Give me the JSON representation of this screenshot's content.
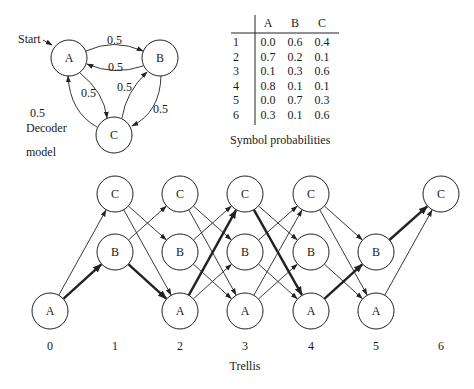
{
  "decoder_model": {
    "caption_line1": "Decoder",
    "caption_line2": "model",
    "start_label": "Start",
    "states": [
      {
        "id": "A",
        "label": "A",
        "cx": 69,
        "cy": 58
      },
      {
        "id": "B",
        "label": "B",
        "cx": 160,
        "cy": 58
      },
      {
        "id": "C",
        "label": "C",
        "cx": 114,
        "cy": 135
      }
    ],
    "transitions": [
      {
        "from": "A",
        "to": "B",
        "prob": "0.5"
      },
      {
        "from": "B",
        "to": "A",
        "prob": "0.5"
      },
      {
        "from": "A",
        "to": "C",
        "prob": "0.5"
      },
      {
        "from": "C",
        "to": "A",
        "prob": "0.5"
      },
      {
        "from": "C",
        "to": "B",
        "prob": "0.5"
      },
      {
        "from": "B",
        "to": "C",
        "prob": "0.5"
      }
    ]
  },
  "symbol_table": {
    "caption": "Symbol probabilities",
    "columns": [
      "A",
      "B",
      "C"
    ],
    "rows": [
      {
        "symbol": "1",
        "values": [
          "0.0",
          "0.6",
          "0.4"
        ]
      },
      {
        "symbol": "2",
        "values": [
          "0.7",
          "0.2",
          "0.1"
        ]
      },
      {
        "symbol": "3",
        "values": [
          "0.1",
          "0.3",
          "0.6"
        ]
      },
      {
        "symbol": "4",
        "values": [
          "0.8",
          "0.1",
          "0.1"
        ]
      },
      {
        "symbol": "5",
        "values": [
          "0.0",
          "0.7",
          "0.3"
        ]
      },
      {
        "symbol": "6",
        "values": [
          "0.3",
          "0.1",
          "0.6"
        ]
      }
    ]
  },
  "trellis": {
    "caption": "Trellis",
    "time_steps": [
      "0",
      "1",
      "2",
      "3",
      "4",
      "5",
      "6"
    ],
    "time_x": [
      50,
      115,
      180,
      245,
      311,
      376,
      441
    ],
    "state_y": {
      "C": 194,
      "B": 252,
      "A": 311
    },
    "nodes": [
      {
        "t": 0,
        "s": "A"
      },
      {
        "t": 1,
        "s": "C"
      },
      {
        "t": 1,
        "s": "B"
      },
      {
        "t": 2,
        "s": "C"
      },
      {
        "t": 2,
        "s": "B"
      },
      {
        "t": 2,
        "s": "A"
      },
      {
        "t": 3,
        "s": "C"
      },
      {
        "t": 3,
        "s": "B"
      },
      {
        "t": 3,
        "s": "A"
      },
      {
        "t": 4,
        "s": "C"
      },
      {
        "t": 4,
        "s": "B"
      },
      {
        "t": 4,
        "s": "A"
      },
      {
        "t": 5,
        "s": "B"
      },
      {
        "t": 5,
        "s": "A"
      },
      {
        "t": 6,
        "s": "C"
      }
    ],
    "edges": [
      {
        "t": 0,
        "from": "A",
        "to": "C",
        "bold": false
      },
      {
        "t": 0,
        "from": "A",
        "to": "B",
        "bold": true
      },
      {
        "t": 1,
        "from": "C",
        "to": "B",
        "bold": false
      },
      {
        "t": 1,
        "from": "C",
        "to": "A",
        "bold": false
      },
      {
        "t": 1,
        "from": "B",
        "to": "C",
        "bold": false
      },
      {
        "t": 1,
        "from": "B",
        "to": "A",
        "bold": true
      },
      {
        "t": 2,
        "from": "C",
        "to": "B",
        "bold": false
      },
      {
        "t": 2,
        "from": "C",
        "to": "A",
        "bold": false
      },
      {
        "t": 2,
        "from": "B",
        "to": "C",
        "bold": false
      },
      {
        "t": 2,
        "from": "B",
        "to": "A",
        "bold": false
      },
      {
        "t": 2,
        "from": "A",
        "to": "C",
        "bold": true
      },
      {
        "t": 2,
        "from": "A",
        "to": "B",
        "bold": false
      },
      {
        "t": 3,
        "from": "C",
        "to": "B",
        "bold": false
      },
      {
        "t": 3,
        "from": "C",
        "to": "A",
        "bold": true
      },
      {
        "t": 3,
        "from": "B",
        "to": "C",
        "bold": false
      },
      {
        "t": 3,
        "from": "B",
        "to": "A",
        "bold": false
      },
      {
        "t": 3,
        "from": "A",
        "to": "C",
        "bold": false
      },
      {
        "t": 3,
        "from": "A",
        "to": "B",
        "bold": false
      },
      {
        "t": 4,
        "from": "C",
        "to": "B",
        "bold": false
      },
      {
        "t": 4,
        "from": "C",
        "to": "A",
        "bold": false
      },
      {
        "t": 4,
        "from": "B",
        "to": "A",
        "bold": false
      },
      {
        "t": 4,
        "from": "A",
        "to": "B",
        "bold": true
      },
      {
        "t": 5,
        "from": "B",
        "to": "C",
        "bold": true
      },
      {
        "t": 5,
        "from": "A",
        "to": "C",
        "bold": false
      }
    ],
    "best_path": [
      "A",
      "B",
      "A",
      "C",
      "A",
      "B",
      "C"
    ]
  },
  "colors": {
    "ink": "#222222",
    "background": "#ffffff"
  }
}
